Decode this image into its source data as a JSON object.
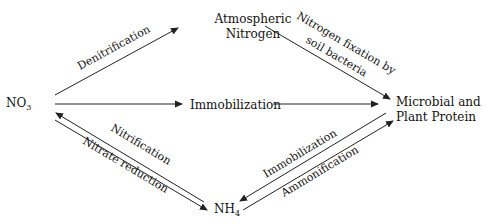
{
  "diagram": {
    "colors": {
      "line": "#222222",
      "text": "#111111",
      "background": "#ffffff"
    },
    "nodes": {
      "no3": {
        "label": "NO",
        "subscript": "3"
      },
      "atmospheric": {
        "line1": "Atmospheric",
        "line2": "Nitrogen"
      },
      "immobilization_mid": {
        "label": "Immobilization"
      },
      "microbial": {
        "line1": "Microbial and",
        "line2": "Plant Protein"
      },
      "nh4": {
        "label": "NH",
        "subscript": "4"
      }
    },
    "edges": {
      "denitrification": {
        "label": "Denitrification",
        "from": "NO3",
        "to": "Atmospheric Nitrogen"
      },
      "fixation": {
        "line1": "Nitrogen fixation by",
        "line2": "soil bacteria",
        "from": "Atmospheric Nitrogen",
        "to": "Microbial and Plant Protein"
      },
      "immobilization_direct": {
        "from": "NO3",
        "to": "Microbial and Plant Protein"
      },
      "nitrification": {
        "label": "Nitrification",
        "from": "NH4",
        "to": "NO3"
      },
      "nitrate_reduction": {
        "label": "Nitrate reduction",
        "from": "NO3",
        "to": "NH4"
      },
      "immobilization_nh4": {
        "label": "Immobilization",
        "from": "Microbial and Plant Protein",
        "to": "NH4"
      },
      "ammonification": {
        "label": "Ammonification",
        "from": "NH4",
        "to": "Microbial and Plant Protein"
      }
    }
  }
}
